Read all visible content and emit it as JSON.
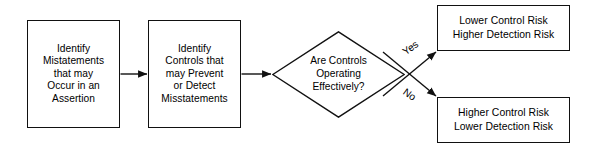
{
  "diagram": {
    "type": "flowchart",
    "background_color": "#ffffff",
    "line_color": "#111111",
    "text_color": "#000000"
  },
  "nodes": {
    "identify_misstatements": {
      "shape": "process",
      "lines": [
        "Identify",
        "Mistatements",
        "that may",
        "Occur in an",
        "Assertion"
      ]
    },
    "identify_controls": {
      "shape": "process",
      "lines": [
        "Identify",
        "Controls that",
        "may Prevent",
        "or Detect",
        "Misstatements"
      ]
    },
    "controls_effective_decision": {
      "shape": "decision",
      "lines": [
        "Are Controls",
        "Operating",
        "Effectively?"
      ]
    },
    "lower_control_risk": {
      "shape": "process",
      "lines": [
        "Lower Control Risk",
        "Higher Detection Risk"
      ]
    },
    "higher_control_risk": {
      "shape": "process",
      "lines": [
        "Higher Control Risk",
        "Lower Detection Risk"
      ]
    }
  },
  "edges": {
    "misstatements_to_controls": {
      "label": ""
    },
    "controls_to_decision": {
      "label": ""
    },
    "decision_yes": {
      "label": "Yes"
    },
    "decision_no": {
      "label": "No"
    }
  }
}
